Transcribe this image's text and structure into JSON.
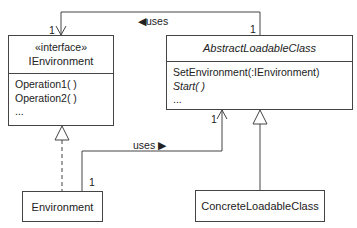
{
  "classes": {
    "ienvironment": {
      "stereotype": "«interface»",
      "name": "IEnvironment",
      "operations": [
        "Operation1( )",
        "Operation2( )",
        "..."
      ]
    },
    "abstract_loadable": {
      "name": "AbstractLoadableClass",
      "operations": [
        "SetEnvironment(:IEnvironment)",
        "Start( )",
        "..."
      ]
    },
    "environment": {
      "name": "Environment"
    },
    "concrete_loadable": {
      "name": "ConcreteLoadableClass"
    }
  },
  "associations": {
    "top_uses": {
      "label": "◀uses",
      "mult_source": "1",
      "mult_target": "1"
    },
    "bottom_uses": {
      "label": "uses ▶",
      "mult_source": "1",
      "mult_target": "1"
    }
  },
  "colors": {
    "line": "#444444",
    "text": "#222222"
  }
}
